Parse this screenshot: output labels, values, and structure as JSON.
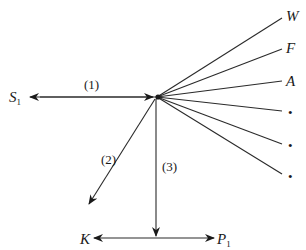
{
  "diagram": {
    "center": {
      "x": 156,
      "y": 97
    },
    "labels": {
      "s1": {
        "main": "S",
        "sub": "1"
      },
      "k": "K",
      "p1": {
        "main": "P",
        "sub": "1"
      },
      "w": "W",
      "f": "F",
      "a": "A",
      "path1": "(1)",
      "path2": "(2)",
      "path3": "(3)"
    },
    "fan_lines": [
      {
        "label": "W",
        "x": 282,
        "y": 18
      },
      {
        "label": "F",
        "x": 282,
        "y": 49
      },
      {
        "label": "A",
        "x": 282,
        "y": 81
      },
      {
        "label": "•",
        "x": 282,
        "y": 111
      },
      {
        "label": "•",
        "x": 282,
        "y": 144
      },
      {
        "label": "•",
        "x": 282,
        "y": 174
      }
    ],
    "dots": [
      "•",
      "•",
      "•"
    ],
    "colors": {
      "stroke": "#2a2a2a",
      "background": "#ffffff"
    }
  }
}
